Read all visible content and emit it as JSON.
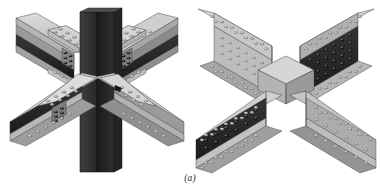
{
  "figure": {
    "caption": "(a)",
    "background_color": "#ffffff",
    "panels": [
      {
        "id": "left-assembly",
        "name": "four-way beam to column moment connection",
        "description": "Central dark vertical column with four wide-flange beams framing in at the four diagonal directions, each spliced with bolted flange cover plates and web plates.",
        "members": [
          {
            "name": "column",
            "orientation": "vertical",
            "shade": "dark"
          },
          {
            "name": "beam-upper-left",
            "orientation": "diagonal",
            "shade": "light"
          },
          {
            "name": "beam-upper-right",
            "orientation": "diagonal",
            "shade": "light"
          },
          {
            "name": "beam-lower-left",
            "orientation": "diagonal",
            "shade": "light"
          },
          {
            "name": "beam-lower-right",
            "orientation": "diagonal",
            "shade": "light"
          }
        ]
      },
      {
        "id": "right-assembly",
        "name": "cross beam splice connection",
        "description": "Two wide-flange beams crossing in an X, with bolted top and bottom flange plates and bolted web splice plates at the intersection.",
        "members": [
          {
            "name": "beam-northwest-arm",
            "orientation": "diagonal",
            "shade": "light"
          },
          {
            "name": "beam-northeast-arm",
            "orientation": "diagonal",
            "shade": "light"
          },
          {
            "name": "beam-southwest-arm",
            "orientation": "diagonal",
            "shade": "light"
          },
          {
            "name": "beam-southeast-arm",
            "orientation": "diagonal",
            "shade": "light"
          }
        ]
      }
    ],
    "colors": {
      "plate_light": "#c9c9c9",
      "plate_mid": "#a8a8a8",
      "plate_shadow": "#8d8d8d",
      "web_dark": "#2e2e2e",
      "web_darker": "#1d1d1d",
      "bolt_head": "#7c7c7c",
      "bolt_highlight": "#e2e2e2",
      "outline": "#3a3a3a",
      "caption_color": "#2b2b2b"
    }
  }
}
